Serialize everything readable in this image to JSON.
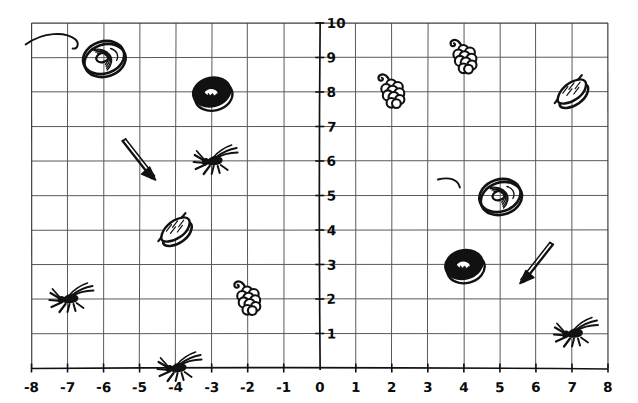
{
  "figure": {
    "title": "",
    "background_color": "#ffffff",
    "ink_color": "#111111",
    "grid_color": "#555a5e"
  },
  "chart_data": {
    "type": "scatter",
    "title": "",
    "xlabel": "",
    "ylabel": "",
    "xlim": [
      -8,
      8
    ],
    "ylim": [
      0,
      10
    ],
    "grid": true,
    "legend": "none",
    "x_ticks": [
      -8,
      -7,
      -6,
      -5,
      -4,
      -3,
      -2,
      -1,
      0,
      1,
      2,
      3,
      4,
      5,
      6,
      7,
      8
    ],
    "x_tick_labels": [
      "-8",
      "-7",
      "-6",
      "-5",
      "-4",
      "-3",
      "-2",
      "-1",
      "0",
      "1",
      "2",
      "3",
      "4",
      "5",
      "6",
      "7",
      "8"
    ],
    "y_ticks": [
      0,
      1,
      2,
      3,
      4,
      5,
      6,
      7,
      8,
      9,
      10
    ],
    "y_tick_labels": [
      "0",
      "1",
      "2",
      "3",
      "4",
      "5",
      "6",
      "7",
      "8",
      "9",
      "10"
    ],
    "categories": [
      "donut-ring",
      "donut-dark",
      "grapes",
      "lemon",
      "bug",
      "arrow"
    ],
    "points": [
      {
        "label": "donut-ring",
        "icon": "donut-ring-icon",
        "x": -6.0,
        "y": 9.0
      },
      {
        "label": "donut-dark",
        "icon": "donut-dark-icon",
        "x": -3.0,
        "y": 8.0
      },
      {
        "label": "arrow",
        "icon": "arrow-icon",
        "x": -5.0,
        "y": 6.0
      },
      {
        "label": "bug",
        "icon": "bug-icon",
        "x": -3.0,
        "y": 6.0
      },
      {
        "label": "lemon",
        "icon": "lemon-icon",
        "x": -4.0,
        "y": 4.0
      },
      {
        "label": "bug",
        "icon": "bug-icon",
        "x": -7.0,
        "y": 2.0
      },
      {
        "label": "grapes",
        "icon": "grapes-icon",
        "x": -2.0,
        "y": 2.0
      },
      {
        "label": "bug",
        "icon": "bug-icon",
        "x": -4.0,
        "y": 0.0
      },
      {
        "label": "grapes",
        "icon": "grapes-icon",
        "x": 2.0,
        "y": 8.0
      },
      {
        "label": "grapes",
        "icon": "grapes-icon",
        "x": 4.0,
        "y": 9.0
      },
      {
        "label": "lemon",
        "icon": "lemon-icon",
        "x": 7.0,
        "y": 8.0
      },
      {
        "label": "donut-ring",
        "icon": "donut-ring-icon",
        "x": 5.0,
        "y": 5.0
      },
      {
        "label": "donut-dark",
        "icon": "donut-dark-icon",
        "x": 4.0,
        "y": 3.0
      },
      {
        "label": "arrow",
        "icon": "arrow-icon",
        "x": 6.0,
        "y": 3.0
      },
      {
        "label": "bug",
        "icon": "bug-icon",
        "x": 7.0,
        "y": 1.0
      }
    ],
    "icon_counts": {
      "donut-ring": 2,
      "donut-dark": 2,
      "grapes": 3,
      "lemon": 2,
      "bug": 4,
      "arrow": 2
    }
  }
}
